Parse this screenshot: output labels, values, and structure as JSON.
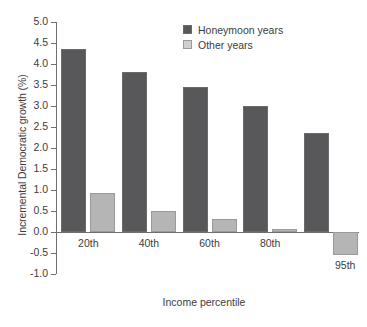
{
  "chart_data": {
    "type": "bar",
    "title": "",
    "subtitle": "",
    "xlabel": "Income percentile",
    "ylabel": "Incremental Democratic growth (%)",
    "categories": [
      "20th",
      "40th",
      "60th",
      "80th",
      "95th"
    ],
    "series": [
      {
        "name": "Honeymoon years",
        "color": "#58585a",
        "values": [
          4.35,
          3.82,
          3.45,
          3.0,
          2.35
        ]
      },
      {
        "name": "Other years",
        "color": "#b5b5b5",
        "values": [
          0.92,
          0.5,
          0.3,
          0.07,
          -0.55
        ]
      }
    ],
    "ylim": [
      -1.0,
      5.0
    ],
    "yticks": [
      5.0,
      4.5,
      4.0,
      3.5,
      3.0,
      2.5,
      2.0,
      1.5,
      1.0,
      0.5,
      0.0,
      -0.5,
      -1.0
    ],
    "ytick_labels": [
      "5.0",
      "4.5",
      "4.0",
      "3.5",
      "3.0",
      "2.5",
      "2.0",
      "1.5",
      "1.0",
      "0.5",
      "0.0",
      "-0.5",
      "-1.0"
    ],
    "grid": false,
    "legend_position": "top-right-inside",
    "axis_color": "#6f6f6f",
    "background": "#ffffff"
  }
}
